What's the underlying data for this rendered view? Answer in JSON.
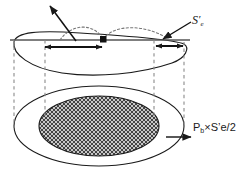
{
  "figure": {
    "background_color": "#ffffff",
    "stroke_color": "#1a1a1a",
    "hatch_color": "#4d4d4d",
    "dashed_color": "#808080"
  },
  "labels": {
    "stress_amplitude": {
      "text": "S",
      "prime": "′",
      "subscript": "e",
      "full": "S′e"
    },
    "bolt_force": {
      "prefix": "P",
      "subscript": "b",
      "suffix": "×S’e/2",
      "full": "Pb×S’e/2"
    }
  },
  "annotations": {
    "pointer_arrow_label": "surface-pointer-arrow",
    "se_leader_label": "se-leader-arrow",
    "force_leader_label": "force-leader-arrow",
    "left_dimension_label": "left-dimension-arrow",
    "right_dimension_label": "right-dimension-arrow",
    "marker_label": "contact-point-marker"
  },
  "geometry": {
    "baseline_y": 40,
    "dashed_verticals_x": [
      14,
      45,
      154,
      184
    ],
    "left_dimension_span": [
      43,
      103
    ],
    "right_dimension_span": [
      155,
      184
    ],
    "marker_point": [
      103,
      40
    ],
    "top_ellipse_center": [
      99,
      58
    ],
    "bottom_outer_ellipse": {
      "cx": 99,
      "cy": 126,
      "rx": 85,
      "ry": 40
    },
    "bottom_inner_ellipse": {
      "cx": 99,
      "cy": 126,
      "rx": 60,
      "ry": 30
    }
  }
}
